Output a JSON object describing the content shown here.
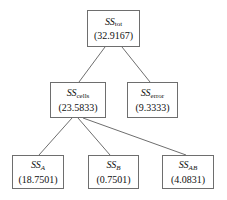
{
  "diagram": {
    "background_color": "#ffffff",
    "line_color": "#6e6e6e",
    "border_color": "#6e6e6e",
    "text_color": "#111111",
    "nodes": [
      {
        "id": "sstot",
        "symbol_base": "SS",
        "symbol_sub": "tot",
        "sub_style": "roman",
        "value": "(32.9167)"
      },
      {
        "id": "sscells",
        "symbol_base": "SS",
        "symbol_sub": "cells",
        "sub_style": "roman",
        "value": "(23.5833)"
      },
      {
        "id": "sserror",
        "symbol_base": "SS",
        "symbol_sub": "error",
        "sub_style": "roman",
        "value": "(9.3333)"
      },
      {
        "id": "ssa",
        "symbol_base": "SS",
        "symbol_sub": "A",
        "sub_style": "italic",
        "value": "(18.7501)"
      },
      {
        "id": "ssb",
        "symbol_base": "SS",
        "symbol_sub": "B",
        "sub_style": "italic",
        "value": "(0.7501)"
      },
      {
        "id": "ssab",
        "symbol_base": "SS",
        "symbol_sub": "AB",
        "sub_style": "italic",
        "value": "(4.0831)"
      }
    ],
    "edges": [
      {
        "from": "sstot",
        "to": "sscells"
      },
      {
        "from": "sstot",
        "to": "sserror"
      },
      {
        "from": "sscells",
        "to": "ssa"
      },
      {
        "from": "sscells",
        "to": "ssb"
      },
      {
        "from": "sscells",
        "to": "ssab"
      }
    ]
  }
}
